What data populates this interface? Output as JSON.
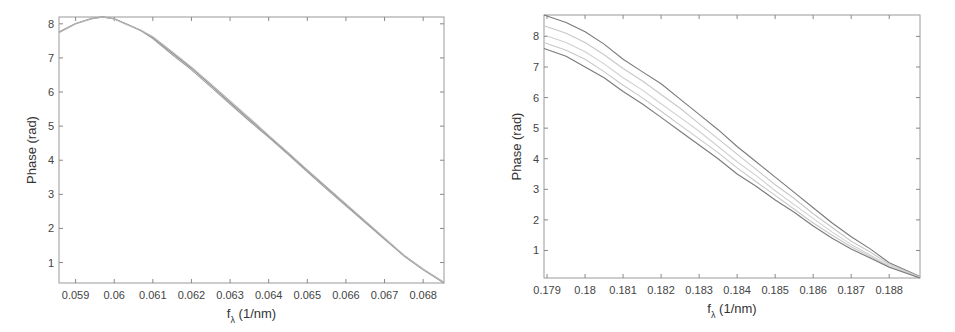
{
  "chart_data": [
    {
      "type": "line",
      "title": "",
      "xlabel": "f_λ (1/nm)",
      "xlabel_main": "f",
      "xlabel_sub": "λ",
      "xlabel_unit": "(1/nm)",
      "ylabel": "Phase (rad)",
      "xlim": [
        0.05857,
        0.06854
      ],
      "ylim": [
        0.4,
        8.2
      ],
      "grid": false,
      "legend": null,
      "x_ticks": [
        0.059,
        0.06,
        0.061,
        0.062,
        0.063,
        0.064,
        0.065,
        0.066,
        0.067,
        0.068
      ],
      "x_tick_labels": [
        "0.059",
        "0.06",
        "0.061",
        "0.062",
        "0.063",
        "0.064",
        "0.065",
        "0.066",
        "0.067",
        "0.068"
      ],
      "y_ticks": [
        1,
        2,
        3,
        4,
        5,
        6,
        7,
        8
      ],
      "y_tick_labels": [
        "1",
        "2",
        "3",
        "4",
        "5",
        "6",
        "7",
        "8"
      ],
      "x": [
        0.05857,
        0.059,
        0.0594,
        0.0597,
        0.06,
        0.0603,
        0.0607,
        0.061,
        0.0615,
        0.062,
        0.0625,
        0.063,
        0.0635,
        0.064,
        0.0645,
        0.065,
        0.0655,
        0.066,
        0.0665,
        0.067,
        0.0675,
        0.068,
        0.06854
      ],
      "series": [
        {
          "name": "curve 1",
          "color": "#8a8a8a",
          "values": [
            7.75,
            8.0,
            8.15,
            8.2,
            8.15,
            8.0,
            7.8,
            7.6,
            7.15,
            6.7,
            6.2,
            5.7,
            5.2,
            4.7,
            4.2,
            3.7,
            3.2,
            2.7,
            2.2,
            1.7,
            1.2,
            0.8,
            0.4
          ]
        },
        {
          "name": "curve 2",
          "color": "#a0a0a0",
          "values": [
            7.76,
            8.01,
            8.16,
            8.21,
            8.15,
            8.0,
            7.79,
            7.57,
            7.1,
            6.65,
            6.15,
            5.65,
            5.15,
            4.67,
            4.17,
            3.66,
            3.15,
            2.66,
            2.17,
            1.68,
            1.2,
            0.79,
            0.41
          ]
        },
        {
          "name": "curve 3",
          "color": "#b5b5b5",
          "values": [
            7.74,
            8.0,
            8.14,
            8.19,
            8.14,
            7.99,
            7.8,
            7.62,
            7.18,
            6.73,
            6.24,
            5.74,
            5.24,
            4.73,
            4.23,
            3.72,
            3.22,
            2.72,
            2.22,
            1.72,
            1.22,
            0.81,
            0.42
          ]
        }
      ]
    },
    {
      "type": "line",
      "title": "",
      "xlabel": "f_λ (1/nm)",
      "xlabel_main": "f",
      "xlabel_sub": "λ",
      "xlabel_unit": "(1/nm)",
      "ylabel": "Phase (rad)",
      "xlim": [
        0.17892,
        0.18881
      ],
      "ylim": [
        0.1,
        8.7
      ],
      "grid": false,
      "legend": null,
      "x_ticks": [
        0.179,
        0.18,
        0.181,
        0.182,
        0.183,
        0.184,
        0.185,
        0.186,
        0.187,
        0.188
      ],
      "x_tick_labels": [
        "0.179",
        "0.18",
        "0.181",
        "0.182",
        "0.183",
        "0.184",
        "0.185",
        "0.186",
        "0.187",
        "0.188"
      ],
      "y_ticks": [
        1,
        2,
        3,
        4,
        5,
        6,
        7,
        8
      ],
      "y_tick_labels": [
        "1",
        "2",
        "3",
        "4",
        "5",
        "6",
        "7",
        "8"
      ],
      "x": [
        0.17892,
        0.1795,
        0.18,
        0.1805,
        0.181,
        0.1815,
        0.182,
        0.1825,
        0.183,
        0.1835,
        0.184,
        0.1845,
        0.185,
        0.1855,
        0.186,
        0.1865,
        0.187,
        0.1875,
        0.188,
        0.18881
      ],
      "series": [
        {
          "name": "upper curve",
          "color": "#7a7a7a",
          "values": [
            8.7,
            8.45,
            8.15,
            7.75,
            7.25,
            6.85,
            6.45,
            5.95,
            5.45,
            4.95,
            4.4,
            3.9,
            3.4,
            2.9,
            2.4,
            1.9,
            1.45,
            1.05,
            0.6,
            0.15
          ]
        },
        {
          "name": "middle curve 1",
          "color": "#c8c8c8",
          "values": [
            8.35,
            8.1,
            7.8,
            7.4,
            6.95,
            6.55,
            6.1,
            5.65,
            5.15,
            4.65,
            4.15,
            3.65,
            3.15,
            2.7,
            2.2,
            1.75,
            1.3,
            0.95,
            0.55,
            0.13
          ]
        },
        {
          "name": "middle curve 2",
          "color": "#d0d0d0",
          "values": [
            8.05,
            7.8,
            7.5,
            7.1,
            6.65,
            6.25,
            5.8,
            5.35,
            4.9,
            4.4,
            3.9,
            3.45,
            2.95,
            2.5,
            2.05,
            1.6,
            1.2,
            0.85,
            0.5,
            0.12
          ]
        },
        {
          "name": "middle curve 3",
          "color": "#c8c8c8",
          "values": [
            7.8,
            7.55,
            7.25,
            6.85,
            6.4,
            6.0,
            5.55,
            5.1,
            4.65,
            4.2,
            3.7,
            3.25,
            2.8,
            2.35,
            1.9,
            1.5,
            1.12,
            0.8,
            0.47,
            0.11
          ]
        },
        {
          "name": "lower curve",
          "color": "#7a7a7a",
          "values": [
            7.6,
            7.35,
            7.0,
            6.65,
            6.2,
            5.8,
            5.35,
            4.9,
            4.45,
            4.0,
            3.5,
            3.1,
            2.65,
            2.25,
            1.8,
            1.4,
            1.05,
            0.75,
            0.45,
            0.1
          ]
        }
      ]
    }
  ]
}
